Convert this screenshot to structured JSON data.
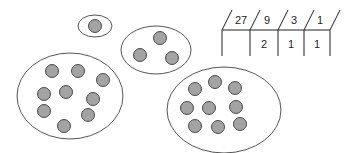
{
  "diagram": {
    "colors": {
      "dot_fill": "#a3a3a3",
      "dot_stroke": "#4a4a4a",
      "outline": "#555555",
      "text": "#222222"
    },
    "groups": [
      {
        "name": "single",
        "ellipse": {
          "cx": 95,
          "cy": 26,
          "rx": 17,
          "ry": 11
        },
        "count": 1,
        "dots": [
          [
            95,
            26
          ]
        ]
      },
      {
        "name": "group-of-three",
        "ellipse": {
          "cx": 156,
          "cy": 50,
          "rx": 35,
          "ry": 24
        },
        "count": 3,
        "dots": [
          [
            160,
            38
          ],
          [
            140,
            55
          ],
          [
            172,
            58
          ]
        ]
      },
      {
        "name": "group-of-nine-left",
        "ellipse": {
          "cx": 70,
          "cy": 96,
          "rx": 53,
          "ry": 43
        },
        "count": 9,
        "dots": [
          [
            52,
            71
          ],
          [
            78,
            71
          ],
          [
            103,
            80
          ],
          [
            44,
            94
          ],
          [
            66,
            92
          ],
          [
            93,
            99
          ],
          [
            44,
            111
          ],
          [
            88,
            115
          ],
          [
            64,
            126
          ]
        ]
      },
      {
        "name": "group-of-nine-right",
        "ellipse": {
          "cx": 224,
          "cy": 110,
          "rx": 57,
          "ry": 43
        },
        "count": 9,
        "dots": [
          [
            195,
            89
          ],
          [
            215,
            82
          ],
          [
            235,
            88
          ],
          [
            187,
            108
          ],
          [
            209,
            108
          ],
          [
            236,
            107
          ],
          [
            195,
            126
          ],
          [
            218,
            127
          ],
          [
            240,
            124
          ]
        ]
      }
    ],
    "place_value_table": {
      "headers": [
        "27",
        "9",
        "3",
        "1"
      ],
      "values": [
        "",
        "2",
        "1",
        "1"
      ]
    }
  }
}
